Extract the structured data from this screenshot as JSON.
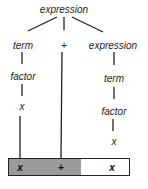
{
  "diagram": {
    "type": "parse-tree",
    "root": {
      "label": "expression"
    },
    "nodes": [
      {
        "id": "root",
        "label": "expression"
      },
      {
        "id": "term_left",
        "label": "term"
      },
      {
        "id": "plus",
        "label": "+"
      },
      {
        "id": "expr_right",
        "label": "expression"
      },
      {
        "id": "factor_left",
        "label": "factor"
      },
      {
        "id": "x_left",
        "label": "x"
      },
      {
        "id": "term_right",
        "label": "term"
      },
      {
        "id": "factor_right",
        "label": "factor"
      },
      {
        "id": "x_right",
        "label": "x"
      }
    ],
    "edges": [
      [
        "root",
        "term_left"
      ],
      [
        "root",
        "plus"
      ],
      [
        "root",
        "expr_right"
      ],
      [
        "term_left",
        "factor_left"
      ],
      [
        "factor_left",
        "x_left"
      ],
      [
        "expr_right",
        "term_right"
      ],
      [
        "term_right",
        "factor_right"
      ],
      [
        "factor_right",
        "x_right"
      ],
      [
        "x_left",
        "tape_0"
      ],
      [
        "plus",
        "tape_1"
      ]
    ],
    "tape": {
      "tokens": [
        "x",
        "+",
        "x"
      ],
      "shaded_count": 2
    }
  },
  "colors": {
    "line": "#222222",
    "shade": "#9a9a9a"
  }
}
